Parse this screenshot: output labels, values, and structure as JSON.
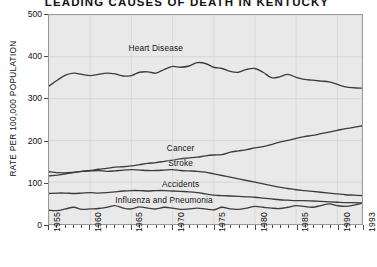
{
  "chart_data": {
    "type": "line",
    "title": "LEADING CAUSES OF DEATH IN KENTUCKY",
    "subtitle": "",
    "xlabel": "",
    "ylabel": "RATE PER 100,000 POPULATION",
    "xlim": [
      1955,
      1993
    ],
    "ylim": [
      0,
      500
    ],
    "yticks": [
      0,
      100,
      200,
      300,
      400,
      500
    ],
    "ytick_labels": [
      "0",
      "100",
      "200",
      "300",
      "400",
      "500"
    ],
    "xticks": [
      1955,
      1960,
      1965,
      1970,
      1975,
      1980,
      1985,
      1990,
      1993
    ],
    "xtick_labels": [
      "1955",
      "1960",
      "1965",
      "1970",
      "1975",
      "1980",
      "1985",
      "1990",
      "1993"
    ],
    "x_minor_interval": 1,
    "grid": true,
    "grid_color": "#d2d2d2",
    "plot_background": "#e9e9e9",
    "line_color": "#3c3c3c",
    "legend_position": "inline-labels",
    "x": [
      1955,
      1956,
      1957,
      1958,
      1959,
      1960,
      1961,
      1962,
      1963,
      1964,
      1965,
      1966,
      1967,
      1968,
      1969,
      1970,
      1971,
      1972,
      1973,
      1974,
      1975,
      1976,
      1977,
      1978,
      1979,
      1980,
      1981,
      1982,
      1983,
      1984,
      1985,
      1986,
      1987,
      1988,
      1989,
      1990,
      1991,
      1992,
      1993
    ],
    "series": [
      {
        "name": "Heart Disease",
        "label_x": 1968,
        "label_y": 420,
        "values": [
          330,
          344,
          356,
          361,
          358,
          355,
          358,
          361,
          359,
          354,
          355,
          363,
          364,
          361,
          370,
          377,
          375,
          378,
          386,
          384,
          375,
          372,
          365,
          363,
          370,
          372,
          363,
          350,
          352,
          358,
          351,
          346,
          344,
          342,
          340,
          334,
          328,
          326,
          325
        ]
      },
      {
        "name": "Cancer",
        "label_x": 1971,
        "label_y": 182,
        "values": [
          115,
          117,
          120,
          123,
          126,
          128,
          131,
          133,
          136,
          137,
          139,
          142,
          145,
          147,
          150,
          153,
          156,
          158,
          160,
          163,
          165,
          166,
          172,
          175,
          178,
          182,
          185,
          190,
          196,
          200,
          205,
          209,
          212,
          216,
          220,
          224,
          228,
          231,
          235
        ]
      },
      {
        "name": "Stroke",
        "label_x": 1971,
        "label_y": 148,
        "values": [
          125,
          123,
          122,
          124,
          126,
          127,
          128,
          126,
          127,
          129,
          130,
          129,
          128,
          128,
          129,
          130,
          128,
          127,
          126,
          124,
          120,
          116,
          112,
          108,
          104,
          100,
          96,
          92,
          88,
          85,
          82,
          80,
          78,
          76,
          74,
          72,
          70,
          69,
          68
        ]
      },
      {
        "name": "Accidents",
        "label_x": 1971,
        "label_y": 96,
        "values": [
          73,
          74,
          74,
          73,
          74,
          75,
          74,
          75,
          77,
          79,
          80,
          80,
          79,
          80,
          80,
          79,
          78,
          77,
          75,
          72,
          69,
          68,
          67,
          66,
          65,
          64,
          62,
          60,
          58,
          57,
          56,
          56,
          55,
          54,
          53,
          52,
          51,
          51,
          50
        ]
      },
      {
        "name": "Influenza and Pneumonia",
        "label_x": 1969,
        "label_y": 60,
        "values": [
          33,
          32,
          36,
          40,
          35,
          36,
          37,
          40,
          44,
          38,
          36,
          41,
          38,
          36,
          40,
          38,
          35,
          36,
          38,
          36,
          34,
          40,
          36,
          35,
          38,
          42,
          40,
          38,
          37,
          40,
          44,
          42,
          40,
          44,
          48,
          44,
          42,
          45,
          50
        ]
      }
    ]
  }
}
